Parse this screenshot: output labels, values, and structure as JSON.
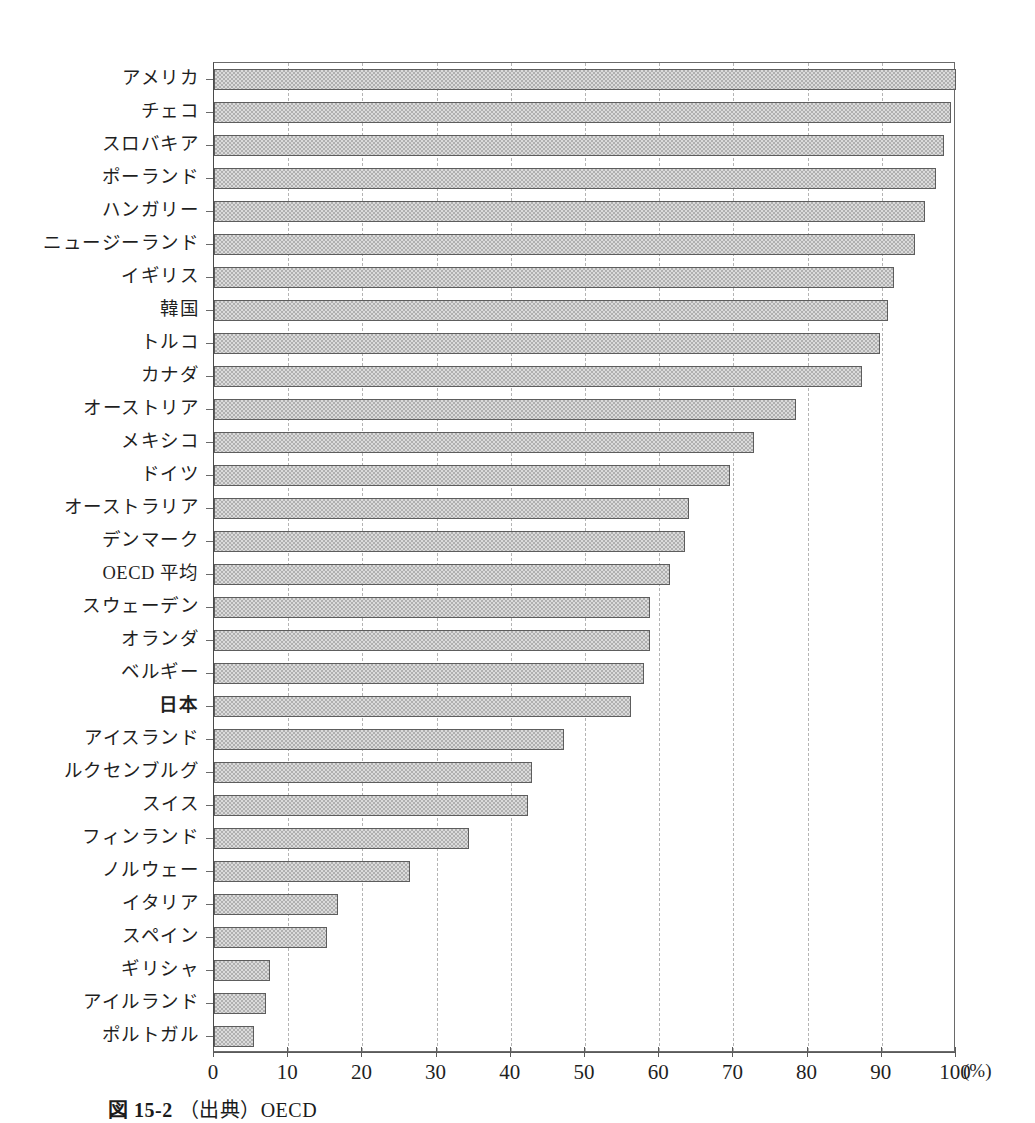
{
  "chart_data": {
    "type": "bar",
    "orientation": "horizontal",
    "title": "",
    "xlabel": "",
    "ylabel": "",
    "unit_label": "(%)",
    "xlim": [
      0,
      100
    ],
    "xticks": [
      0,
      10,
      20,
      30,
      40,
      50,
      60,
      70,
      80,
      90,
      100
    ],
    "grid": "vertical-dashed",
    "legend": "none",
    "categories": [
      "アメリカ",
      "チェコ",
      "スロバキア",
      "ポーランド",
      "ハンガリー",
      "ニュージーランド",
      "イギリス",
      "韓国",
      "トルコ",
      "カナダ",
      "オーストリア",
      "メキシコ",
      "ドイツ",
      "オーストラリア",
      "デンマーク",
      "OECD 平均",
      "スウェーデン",
      "オランダ",
      "ベルギー",
      "日本",
      "アイスランド",
      "ルクセンブルグ",
      "スイス",
      "フィンランド",
      "ノルウェー",
      "イタリア",
      "スペイン",
      "ギリシャ",
      "アイルランド",
      "ポルトガル"
    ],
    "values": [
      100.0,
      99.3,
      98.4,
      97.3,
      95.8,
      94.5,
      91.7,
      90.8,
      89.8,
      87.3,
      78.5,
      72.8,
      69.6,
      64.0,
      63.5,
      61.5,
      58.8,
      58.7,
      58.0,
      56.2,
      47.2,
      42.8,
      42.3,
      34.4,
      26.4,
      16.7,
      15.2,
      7.5,
      7.0,
      5.4
    ],
    "highlight_category": "日本",
    "bar_color": "#b0b0b0",
    "bar_edge_color": "#5d5d5d",
    "grid_color": "#b4b4b4",
    "axis_color": "#5a5a5a"
  },
  "caption": {
    "figure_number": "図 15-2",
    "text": "（出典）OECD"
  }
}
